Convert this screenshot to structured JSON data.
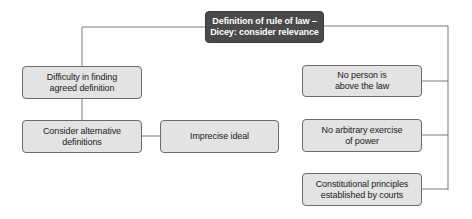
{
  "diagram": {
    "root": {
      "label": "Definition of rule of law –\nDicey: consider relevance"
    },
    "left": [
      {
        "label": "Difficulty in finding\nagreed definition"
      },
      {
        "label": "Consider alternative\ndefinitions"
      },
      {
        "label": "Imprecise ideal"
      }
    ],
    "right": [
      {
        "label": "No person is\nabove the law"
      },
      {
        "label": "No arbitrary exercise\nof power"
      },
      {
        "label": "Constitutional principles\nestablished by courts"
      }
    ],
    "colors": {
      "root_fill": "#4a4a4a",
      "node_fill": "#e3e3e3",
      "line": "#7a7a7a"
    }
  }
}
